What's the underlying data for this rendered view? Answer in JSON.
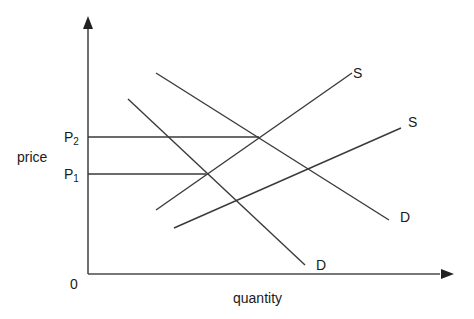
{
  "chart_data": {
    "type": "supply-demand diagram",
    "title": "",
    "xlabel": "quantity",
    "ylabel": "price",
    "origin_label": "0",
    "price_levels": [
      {
        "label": "P",
        "subscript": "2",
        "y": 137,
        "x_end": 259
      },
      {
        "label": "P",
        "subscript": "1",
        "y": 174,
        "x_end": 206
      }
    ],
    "curves": [
      {
        "name": "S",
        "kind": "supply",
        "x1": 156,
        "y1": 210,
        "x2": 352,
        "y2": 73,
        "label_x": 353,
        "label_y": 78
      },
      {
        "name": "S",
        "kind": "supply",
        "x1": 174,
        "y1": 228,
        "x2": 401,
        "y2": 128,
        "label_x": 408,
        "label_y": 127
      },
      {
        "name": "D",
        "kind": "demand",
        "x1": 128,
        "y1": 99,
        "x2": 305,
        "y2": 265,
        "label_x": 316,
        "label_y": 270
      },
      {
        "name": "D",
        "kind": "demand",
        "x1": 156,
        "y1": 73,
        "x2": 389,
        "y2": 220,
        "label_x": 400,
        "label_y": 222
      }
    ],
    "intersections": [
      {
        "curves": [
          "S1",
          "D2"
        ],
        "x": 259,
        "y": 137,
        "price": "P2"
      },
      {
        "curves": [
          "S1",
          "D1"
        ],
        "x": 206,
        "y": 174,
        "price": "P1"
      },
      {
        "curves": [
          "S2",
          "D1"
        ],
        "x": 236,
        "y": 201
      },
      {
        "curves": [
          "S2",
          "D2"
        ],
        "x": 309,
        "y": 170
      }
    ],
    "axes": {
      "origin": [
        88,
        274
      ],
      "y_top": 18,
      "x_right": 450
    },
    "colors": {
      "line": "#3a3a3a",
      "axis": "#4a4a4a",
      "text": "#1a1a1a",
      "background": "#ffffff"
    }
  }
}
